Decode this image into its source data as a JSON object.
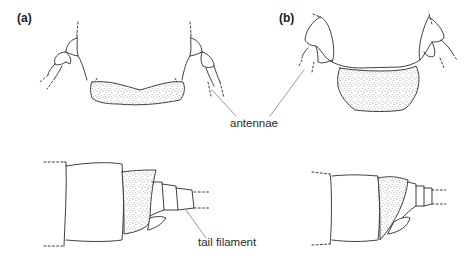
{
  "figure": {
    "panels": [
      {
        "id": "a",
        "label": "(a)"
      },
      {
        "id": "b",
        "label": "(b)"
      }
    ],
    "callouts": {
      "antennae": "antennae",
      "tail_filament": "tail filament"
    },
    "views": [
      {
        "panel": "a",
        "view": "head (top)",
        "shaded": "labrum/clypeus region, wide and narrow"
      },
      {
        "panel": "b",
        "view": "head (top)",
        "shaded": "labrum/clypeus region, narrower and deeper"
      },
      {
        "panel": "a",
        "view": "abdomen tip (bottom)",
        "shaded": "segment before tail"
      },
      {
        "panel": "b",
        "view": "abdomen tip (bottom)",
        "shaded": "oblique segment before tail"
      }
    ],
    "colors": {
      "ink": "#2b2b2b",
      "background": "#ffffff",
      "stipple": "#3a3a3a"
    }
  }
}
